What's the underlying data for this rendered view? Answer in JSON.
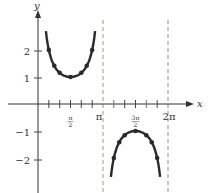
{
  "chart_data": {
    "type": "line",
    "title": "",
    "function": "y = csc x",
    "xlabel": "x",
    "ylabel": "y",
    "x_ticks": [
      {
        "label": "π/2",
        "value": 1.5708
      },
      {
        "label": "π",
        "value": 3.1416
      },
      {
        "label": "3π/2",
        "value": 4.7124
      },
      {
        "label": "2π",
        "value": 6.2832
      }
    ],
    "y_ticks": [
      {
        "label": "2",
        "value": 2
      },
      {
        "label": "1",
        "value": 1
      },
      {
        "label": "−1",
        "value": -1
      },
      {
        "label": "−2",
        "value": -2
      }
    ],
    "asymptotes": [
      3.1416,
      6.2832
    ],
    "xlim": [
      0,
      6.8
    ],
    "ylim": [
      -3,
      3.8
    ],
    "grid": false,
    "series": [
      {
        "name": "csc x (0, π)",
        "points": [
          {
            "x": 0.5236,
            "y": 2
          },
          {
            "x": 0.7854,
            "y": 1.414
          },
          {
            "x": 1.0472,
            "y": 1.155
          },
          {
            "x": 1.5708,
            "y": 1
          },
          {
            "x": 2.0944,
            "y": 1.155
          },
          {
            "x": 2.3562,
            "y": 1.414
          },
          {
            "x": 2.618,
            "y": 2
          }
        ]
      },
      {
        "name": "csc x (π, 2π)",
        "points": [
          {
            "x": 3.6652,
            "y": -2
          },
          {
            "x": 3.927,
            "y": -1.414
          },
          {
            "x": 4.1888,
            "y": -1.155
          },
          {
            "x": 4.7124,
            "y": -1
          },
          {
            "x": 5.236,
            "y": -1.155
          },
          {
            "x": 5.4978,
            "y": -1.414
          },
          {
            "x": 5.7596,
            "y": -2
          }
        ]
      }
    ]
  },
  "labels": {
    "x_axis": "x",
    "y_axis": "y",
    "pi_half_num": "π",
    "pi_half_den": "2",
    "pi": "π",
    "three_pi_half_num": "3π",
    "three_pi_half_den": "2",
    "two_pi": "2π",
    "y2": "2",
    "y1": "1",
    "ym1": "−1",
    "ym2": "−2"
  },
  "colors": {
    "curve": "#2a2a2a",
    "axis": "#333333",
    "asymptote_top": "#9a9a8a",
    "asymptote_bottom": "#8a8ab8",
    "tick_colors": [
      "#333",
      "#6a6a9a",
      "#9a6a9a",
      "#6a9a6a"
    ]
  }
}
